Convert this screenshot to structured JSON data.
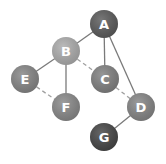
{
  "graph": {
    "nodes": [
      {
        "id": "A",
        "label": "A",
        "x": 104,
        "y": 24,
        "color": "#5a5a5a"
      },
      {
        "id": "B",
        "label": "B",
        "x": 66,
        "y": 51,
        "color": "#acacac"
      },
      {
        "id": "C",
        "label": "C",
        "x": 105,
        "y": 79,
        "color": "#808080"
      },
      {
        "id": "D",
        "label": "D",
        "x": 141,
        "y": 107,
        "color": "#858585"
      },
      {
        "id": "E",
        "label": "E",
        "x": 25,
        "y": 79,
        "color": "#858585"
      },
      {
        "id": "F",
        "label": "F",
        "x": 66,
        "y": 107,
        "color": "#888888"
      },
      {
        "id": "G",
        "label": "G",
        "x": 104,
        "y": 137,
        "color": "#454545"
      }
    ],
    "edges": [
      {
        "from": "A",
        "to": "B",
        "style": "solid"
      },
      {
        "from": "A",
        "to": "C",
        "style": "solid"
      },
      {
        "from": "A",
        "to": "D",
        "style": "solid"
      },
      {
        "from": "B",
        "to": "E",
        "style": "solid"
      },
      {
        "from": "B",
        "to": "F",
        "style": "solid"
      },
      {
        "from": "B",
        "to": "C",
        "style": "dashed"
      },
      {
        "from": "C",
        "to": "D",
        "style": "dashed"
      },
      {
        "from": "E",
        "to": "F",
        "style": "dashed"
      },
      {
        "from": "D",
        "to": "G",
        "style": "solid"
      }
    ],
    "edge_color": "#7a7a7a",
    "dashed_edge_color": "#a0a0a0",
    "node_radius": 14
  }
}
